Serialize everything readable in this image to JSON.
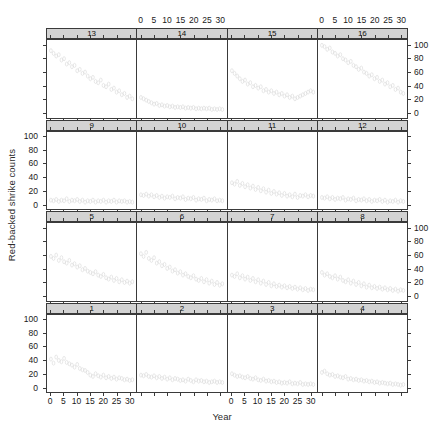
{
  "figure": {
    "xlabel": "Year",
    "ylabel": "Red-backed shrike counts",
    "marker": "open-circle",
    "marker_color": "#d8d8d8",
    "frame_color": "#3a3a3a",
    "strip_color": "#d3d3d3"
  },
  "chart_data": {
    "type": "scatter",
    "title": "",
    "xlabel": "Year",
    "ylabel": "Red-backed shrike counts",
    "xlim": [
      -1.5,
      32.5
    ],
    "ylim": [
      -8,
      108
    ],
    "xticks": [
      0,
      5,
      10,
      15,
      20,
      25,
      30
    ],
    "yticks": [
      0,
      20,
      40,
      60,
      80,
      100
    ],
    "xtick_labels": [
      "0",
      "5",
      "10",
      "15",
      "20",
      "25",
      "30"
    ],
    "ytick_labels": [
      "0",
      "20",
      "40",
      "60",
      "80",
      "100"
    ],
    "grid": false,
    "legend": false,
    "layout": {
      "rows": 4,
      "cols": 4,
      "panel_order": "bottom-left-to-top-right",
      "strip_position": "top",
      "xaxis_alternating": true,
      "yaxis_alternating": true
    },
    "panels": [
      {
        "label": "1",
        "row": 4,
        "col": 1,
        "x": [
          0,
          1,
          2,
          3,
          4,
          5,
          6,
          7,
          8,
          9,
          10,
          11,
          12,
          13,
          14,
          15,
          16,
          17,
          18,
          19,
          20,
          21,
          22,
          23,
          24,
          25,
          26,
          27,
          28,
          29,
          30,
          31
        ],
        "y": [
          42,
          36,
          45,
          40,
          38,
          43,
          37,
          35,
          33,
          30,
          34,
          28,
          26,
          25,
          22,
          18,
          16,
          20,
          17,
          15,
          18,
          14,
          16,
          13,
          15,
          12,
          14,
          13,
          11,
          12,
          10,
          11
        ]
      },
      {
        "label": "2",
        "row": 4,
        "col": 2,
        "x": [
          0,
          1,
          2,
          3,
          4,
          5,
          6,
          7,
          8,
          9,
          10,
          11,
          12,
          13,
          14,
          15,
          16,
          17,
          18,
          19,
          20,
          21,
          22,
          23,
          24,
          25,
          26,
          27,
          28,
          29,
          30,
          31
        ],
        "y": [
          18,
          17,
          19,
          16,
          15,
          17,
          14,
          16,
          13,
          15,
          12,
          14,
          11,
          13,
          12,
          10,
          11,
          9,
          12,
          10,
          8,
          11,
          9,
          10,
          8,
          9,
          7,
          8,
          9,
          7,
          8,
          7
        ]
      },
      {
        "label": "3",
        "row": 4,
        "col": 3,
        "x": [
          0,
          1,
          2,
          3,
          4,
          5,
          6,
          7,
          8,
          9,
          10,
          11,
          12,
          13,
          14,
          15,
          16,
          17,
          18,
          19,
          20,
          21,
          22,
          23,
          24,
          25,
          26,
          27,
          28,
          29,
          30,
          31
        ],
        "y": [
          20,
          18,
          16,
          17,
          15,
          14,
          16,
          13,
          12,
          14,
          11,
          10,
          12,
          9,
          10,
          8,
          9,
          7,
          8,
          6,
          7,
          6,
          8,
          5,
          6,
          5,
          7,
          4,
          5,
          4,
          5,
          4
        ]
      },
      {
        "label": "4",
        "row": 4,
        "col": 4,
        "x": [
          0,
          1,
          2,
          3,
          4,
          5,
          6,
          7,
          8,
          9,
          10,
          11,
          12,
          13,
          14,
          15,
          16,
          17,
          18,
          19,
          20,
          21,
          22,
          23,
          24,
          25,
          26,
          27,
          28,
          29,
          30,
          31
        ],
        "y": [
          22,
          24,
          20,
          18,
          19,
          16,
          17,
          15,
          14,
          16,
          12,
          13,
          11,
          12,
          10,
          11,
          9,
          10,
          8,
          9,
          7,
          8,
          6,
          7,
          6,
          5,
          6,
          4,
          5,
          4,
          3,
          4
        ]
      },
      {
        "label": "5",
        "row": 3,
        "col": 1,
        "x": [
          0,
          1,
          2,
          3,
          4,
          5,
          6,
          7,
          8,
          9,
          10,
          11,
          12,
          13,
          14,
          15,
          16,
          17,
          18,
          19,
          20,
          21,
          22,
          23,
          24,
          25,
          26,
          27,
          28,
          29,
          30,
          31
        ],
        "y": [
          58,
          55,
          60,
          52,
          56,
          50,
          48,
          52,
          45,
          47,
          42,
          44,
          38,
          40,
          36,
          34,
          32,
          35,
          30,
          28,
          31,
          26,
          24,
          27,
          22,
          25,
          20,
          23,
          19,
          21,
          18,
          20
        ]
      },
      {
        "label": "6",
        "row": 3,
        "col": 2,
        "x": [
          0,
          1,
          2,
          3,
          4,
          5,
          6,
          7,
          8,
          9,
          10,
          11,
          12,
          13,
          14,
          15,
          16,
          17,
          18,
          19,
          20,
          21,
          22,
          23,
          24,
          25,
          26,
          27,
          28,
          29,
          30,
          31
        ],
        "y": [
          62,
          58,
          64,
          55,
          52,
          56,
          48,
          50,
          44,
          46,
          40,
          42,
          36,
          38,
          33,
          35,
          30,
          32,
          28,
          26,
          29,
          24,
          22,
          25,
          20,
          23,
          18,
          21,
          16,
          19,
          15,
          17
        ]
      },
      {
        "label": "7",
        "row": 3,
        "col": 3,
        "x": [
          0,
          1,
          2,
          3,
          4,
          5,
          6,
          7,
          8,
          9,
          10,
          11,
          12,
          13,
          14,
          15,
          16,
          17,
          18,
          19,
          20,
          21,
          22,
          23,
          24,
          25,
          26,
          27,
          28,
          29,
          30,
          31
        ],
        "y": [
          30,
          28,
          32,
          26,
          29,
          24,
          27,
          22,
          25,
          20,
          23,
          18,
          21,
          16,
          19,
          14,
          17,
          13,
          15,
          12,
          14,
          11,
          13,
          10,
          12,
          9,
          11,
          8,
          10,
          7,
          9,
          8
        ]
      },
      {
        "label": "8",
        "row": 3,
        "col": 4,
        "x": [
          0,
          1,
          2,
          3,
          4,
          5,
          6,
          7,
          8,
          9,
          10,
          11,
          12,
          13,
          14,
          15,
          16,
          17,
          18,
          19,
          20,
          21,
          22,
          23,
          24,
          25,
          26,
          27,
          28,
          29,
          30,
          31
        ],
        "y": [
          34,
          30,
          32,
          28,
          26,
          29,
          24,
          27,
          22,
          20,
          23,
          18,
          21,
          16,
          19,
          14,
          17,
          12,
          15,
          11,
          13,
          10,
          12,
          9,
          11,
          8,
          10,
          7,
          9,
          6,
          8,
          7
        ]
      },
      {
        "label": "9",
        "row": 2,
        "col": 1,
        "x": [
          0,
          1,
          2,
          3,
          4,
          5,
          6,
          7,
          8,
          9,
          10,
          11,
          12,
          13,
          14,
          15,
          16,
          17,
          18,
          19,
          20,
          21,
          22,
          23,
          24,
          25,
          26,
          27,
          28,
          29,
          30,
          31
        ],
        "y": [
          6,
          5,
          7,
          4,
          6,
          5,
          8,
          4,
          6,
          5,
          7,
          4,
          6,
          3,
          5,
          4,
          6,
          3,
          5,
          4,
          6,
          3,
          5,
          4,
          6,
          3,
          5,
          4,
          5,
          3,
          4,
          3
        ]
      },
      {
        "label": "10",
        "row": 2,
        "col": 2,
        "x": [
          0,
          1,
          2,
          3,
          4,
          5,
          6,
          7,
          8,
          9,
          10,
          11,
          12,
          13,
          14,
          15,
          16,
          17,
          18,
          19,
          20,
          21,
          22,
          23,
          24,
          25,
          26,
          27,
          28,
          29,
          30,
          31
        ],
        "y": [
          14,
          13,
          15,
          12,
          14,
          11,
          13,
          10,
          12,
          9,
          11,
          10,
          12,
          8,
          10,
          9,
          11,
          7,
          9,
          8,
          10,
          6,
          8,
          7,
          9,
          5,
          7,
          6,
          8,
          5,
          6,
          5
        ]
      },
      {
        "label": "11",
        "row": 2,
        "col": 3,
        "x": [
          0,
          1,
          2,
          3,
          4,
          5,
          6,
          7,
          8,
          9,
          10,
          11,
          12,
          13,
          14,
          15,
          16,
          17,
          18,
          19,
          20,
          21,
          22,
          23,
          24,
          25,
          26,
          27,
          28,
          29,
          30,
          31
        ],
        "y": [
          32,
          30,
          34,
          28,
          31,
          26,
          29,
          24,
          27,
          22,
          25,
          20,
          23,
          18,
          21,
          16,
          19,
          15,
          17,
          13,
          16,
          12,
          14,
          11,
          15,
          10,
          13,
          12,
          14,
          11,
          13,
          12
        ]
      },
      {
        "label": "12",
        "row": 2,
        "col": 4,
        "x": [
          0,
          1,
          2,
          3,
          4,
          5,
          6,
          7,
          8,
          9,
          10,
          11,
          12,
          13,
          14,
          15,
          16,
          17,
          18,
          19,
          20,
          21,
          22,
          23,
          24,
          25,
          26,
          27,
          28,
          29,
          30,
          31
        ],
        "y": [
          10,
          9,
          11,
          8,
          10,
          7,
          9,
          8,
          10,
          6,
          8,
          7,
          9,
          5,
          7,
          6,
          8,
          5,
          7,
          4,
          6,
          5,
          7,
          4,
          6,
          3,
          5,
          4,
          6,
          3,
          5,
          4
        ]
      },
      {
        "label": "13",
        "row": 1,
        "col": 1,
        "x": [
          0,
          1,
          2,
          3,
          4,
          5,
          6,
          7,
          8,
          9,
          10,
          11,
          12,
          13,
          14,
          15,
          16,
          17,
          18,
          19,
          20,
          21,
          22,
          23,
          24,
          25,
          26,
          27,
          28,
          29,
          30,
          31
        ],
        "y": [
          92,
          88,
          84,
          86,
          78,
          80,
          72,
          74,
          68,
          70,
          62,
          64,
          58,
          60,
          54,
          50,
          52,
          46,
          44,
          48,
          40,
          38,
          42,
          34,
          36,
          30,
          32,
          26,
          28,
          22,
          24,
          20
        ]
      },
      {
        "label": "14",
        "row": 1,
        "col": 2,
        "x": [
          0,
          1,
          2,
          3,
          4,
          5,
          6,
          7,
          8,
          9,
          10,
          11,
          12,
          13,
          14,
          15,
          16,
          17,
          18,
          19,
          20,
          21,
          22,
          23,
          24,
          25,
          26,
          27,
          28,
          29,
          30,
          31
        ],
        "y": [
          22,
          20,
          18,
          16,
          14,
          12,
          13,
          10,
          11,
          9,
          10,
          8,
          9,
          7,
          8,
          7,
          8,
          6,
          7,
          6,
          7,
          5,
          6,
          5,
          6,
          5,
          6,
          4,
          5,
          4,
          5,
          4
        ]
      },
      {
        "label": "15",
        "row": 1,
        "col": 3,
        "x": [
          0,
          1,
          2,
          3,
          4,
          5,
          6,
          7,
          8,
          9,
          10,
          11,
          12,
          13,
          14,
          15,
          16,
          17,
          18,
          19,
          20,
          21,
          22,
          23,
          24,
          25,
          26,
          27,
          28,
          29,
          30,
          31
        ],
        "y": [
          62,
          58,
          54,
          50,
          46,
          48,
          42,
          44,
          38,
          40,
          36,
          38,
          32,
          34,
          30,
          32,
          28,
          30,
          26,
          28,
          24,
          26,
          22,
          24,
          20,
          22,
          24,
          26,
          28,
          30,
          32,
          30
        ]
      },
      {
        "label": "16",
        "row": 1,
        "col": 4,
        "x": [
          0,
          1,
          2,
          3,
          4,
          5,
          6,
          7,
          8,
          9,
          10,
          11,
          12,
          13,
          14,
          15,
          16,
          17,
          18,
          19,
          20,
          21,
          22,
          23,
          24,
          25,
          26,
          27,
          28,
          29,
          30,
          31
        ],
        "y": [
          100,
          98,
          94,
          96,
          90,
          88,
          84,
          86,
          80,
          78,
          74,
          76,
          70,
          68,
          64,
          66,
          60,
          58,
          54,
          56,
          50,
          52,
          46,
          48,
          42,
          44,
          38,
          40,
          34,
          36,
          30,
          28
        ]
      }
    ]
  }
}
